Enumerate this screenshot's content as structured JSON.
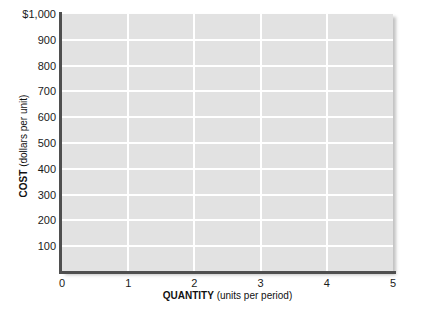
{
  "chart_data": {
    "type": "line",
    "title": "",
    "subtitle": "",
    "xlabel_bold": "QUANTITY",
    "xlabel_rest": " (units per period)",
    "ylabel_bold": "COST",
    "ylabel_rest": " (dollars per unit)",
    "xlim": [
      0,
      5
    ],
    "ylim": [
      0,
      1000
    ],
    "x_ticks": [
      0,
      1,
      2,
      3,
      4,
      5
    ],
    "x_tick_labels": [
      "0",
      "1",
      "2",
      "3",
      "4",
      "5"
    ],
    "y_ticks": [
      100,
      200,
      300,
      400,
      500,
      600,
      700,
      800,
      900,
      1000
    ],
    "y_tick_labels": [
      "100",
      "200",
      "300",
      "400",
      "500",
      "600",
      "700",
      "800",
      "900",
      "$1,000"
    ],
    "grid": true,
    "grid_color": "#ffffff",
    "plot_background": "#e2e2e2",
    "axis_color": "#4f4f4f",
    "legend": [],
    "series": [],
    "annotations": [],
    "note": "Empty grid template; no data series are plotted."
  },
  "figure": {
    "page_background": "#ffffff",
    "tick_label_color": "#1b1b1b",
    "axis_title_color": "#111111"
  }
}
